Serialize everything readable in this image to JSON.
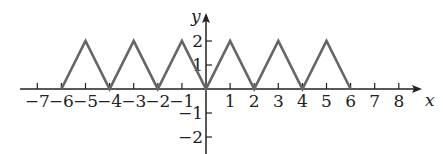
{
  "chart_data": {
    "type": "line",
    "title": "",
    "xlabel": "x",
    "ylabel": "y",
    "xlim": [
      -7,
      8
    ],
    "ylim": [
      -2,
      2
    ],
    "x_ticks": [
      -7,
      -6,
      -5,
      -4,
      -3,
      -2,
      -1,
      1,
      2,
      3,
      4,
      5,
      6,
      7,
      8
    ],
    "x_tick_labels": [
      "−7",
      "−6",
      "−5",
      "−4",
      "−3",
      "−2",
      "−1",
      "1",
      "2",
      "3",
      "4",
      "5",
      "6",
      "7",
      "8"
    ],
    "y_ticks": [
      -2,
      -1,
      1,
      2
    ],
    "y_tick_labels": [
      "−2",
      "−1",
      "1",
      "2"
    ],
    "grid": false,
    "legend": null,
    "series": [
      {
        "name": "triangle wave",
        "color": "#666666",
        "x": [
          -6,
          -5,
          -4,
          -3,
          -2,
          -1,
          0,
          1,
          2,
          3,
          4,
          5,
          6
        ],
        "y": [
          0,
          2,
          0,
          2,
          0,
          2,
          0,
          2,
          0,
          2,
          0,
          2,
          0
        ]
      }
    ]
  },
  "layout": {
    "origin_px": [
      206,
      89
    ],
    "unit_x_px": 24.1,
    "unit_y_px": 24,
    "axis_color": "#222222",
    "line_color": "#666666"
  }
}
